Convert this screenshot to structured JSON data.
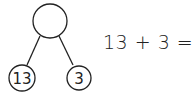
{
  "diagram": {
    "type": "number-bond",
    "whole": "",
    "parts": [
      "13",
      "3"
    ]
  },
  "equation": {
    "left": "13",
    "operator": "+",
    "right": "3",
    "equals": "=",
    "answer": "16"
  }
}
